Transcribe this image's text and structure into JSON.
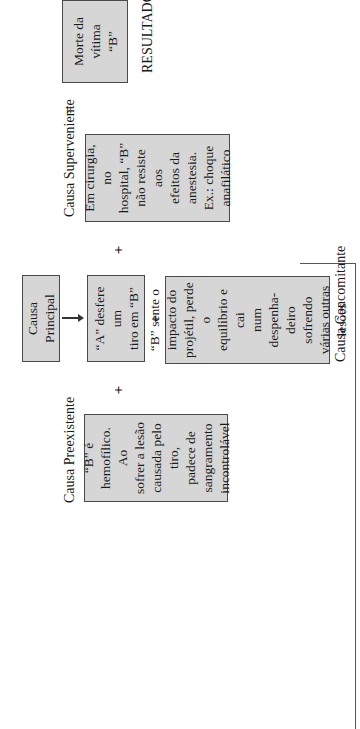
{
  "diagram": {
    "orientation": "rotated -90deg (text reads bottom-to-top)",
    "result": {
      "box_text": "Morte da\nvítima\n“B”",
      "label": "RESULTADO",
      "equals": "="
    },
    "superveniente": {
      "label": "Causa Superveniente",
      "box_text": "Em cirurgia, no\nhospital, “B”\nnão resiste aos\nefeitos da\nanestesia.\nEx.: choque\nanafilático"
    },
    "principal": {
      "label_box": "Causa Principal",
      "box_text": "“A” desfere um\ntiro em “B”"
    },
    "concomitante": {
      "label": "Causa Concomitante",
      "box_text": "“B” sente o\nimpacto do\nprojétil, perde o\nequilíbrio e cai\nnum despenha-\ndeiro sofrendo\nvárias outras\nlesões"
    },
    "preexistente": {
      "label": "Causa Preexistente",
      "box_text": "“B” é\nhemofílico. Ao\nsofrer a lesão\ncausada pelo tiro,\npadece de\nsangramento\nincontrolável"
    },
    "operators": {
      "plus_1": "+",
      "plus_2": "+",
      "plus_3": "+"
    },
    "colors": {
      "box_fill": "#d6d6d6",
      "box_border": "#4a4a4a",
      "text": "#1a1a1a"
    }
  }
}
